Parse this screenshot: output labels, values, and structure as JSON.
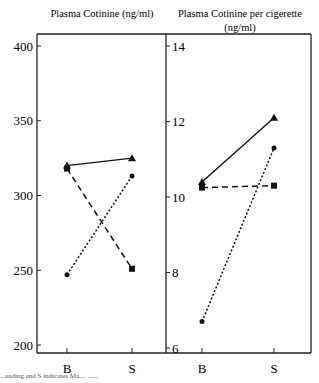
{
  "chart_data": [
    {
      "type": "line",
      "title": "Plasma Cotinine (ng/ml)",
      "xlabel": "",
      "ylabel": "",
      "categories": [
        "B",
        "S"
      ],
      "ylim": [
        195,
        410
      ],
      "yticks": [
        200,
        250,
        300,
        350,
        400
      ],
      "grid": false,
      "series": [
        {
          "name": "triangle-solid",
          "marker": "triangle",
          "line": "solid",
          "values": [
            320,
            325
          ]
        },
        {
          "name": "square-dashed",
          "marker": "square",
          "line": "dashed",
          "values": [
            318,
            251
          ]
        },
        {
          "name": "circle-dotted",
          "marker": "circle",
          "line": "dotted",
          "values": [
            247,
            313
          ]
        }
      ]
    },
    {
      "type": "line",
      "title": "Plasma Cotinine per cigerette (ng/ml)",
      "title_lines": [
        "Plasma Cotinine per cigerette",
        "(ng/ml)"
      ],
      "xlabel": "",
      "ylabel": "",
      "categories": [
        "B",
        "S"
      ],
      "ylim": [
        5.9,
        14.2
      ],
      "yticks": [
        6,
        8,
        10,
        12,
        14
      ],
      "grid": false,
      "series": [
        {
          "name": "triangle-solid",
          "marker": "triangle",
          "line": "solid",
          "values": [
            10.4,
            12.1
          ]
        },
        {
          "name": "square-dashed",
          "marker": "square",
          "line": "dashed",
          "values": [
            10.25,
            10.3
          ]
        },
        {
          "name": "circle-dotted",
          "marker": "circle",
          "line": "dotted",
          "values": [
            6.7,
            11.3
          ]
        }
      ]
    }
  ],
  "caption": "...eading and S indicates Ma.... ......"
}
